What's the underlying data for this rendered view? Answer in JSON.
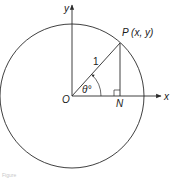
{
  "figure": {
    "labels": {
      "y_axis": "y",
      "x_axis": "x",
      "origin": "O",
      "point_p": "P (x, y)",
      "foot_n": "N",
      "radius": "1",
      "angle": "θ°"
    },
    "caption": "Figure",
    "colors": {
      "stroke": "#2a2a2a",
      "text": "#1a1a1a",
      "background": "#ffffff"
    }
  }
}
